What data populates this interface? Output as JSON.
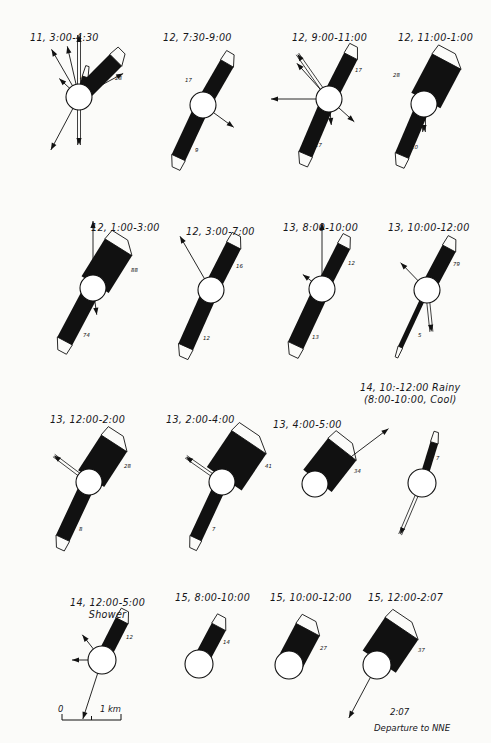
{
  "figure": {
    "type": "scientific-plume-diagram",
    "background_color": "#fbfbf9",
    "ink_color": "#111111",
    "panel_count": 16,
    "rows": 4,
    "columns": 4
  },
  "scale_bar": {
    "zero_label": "0",
    "length_label": "1 km"
  },
  "panels": [
    {
      "id": "p1",
      "title": "11, 3:00-4:30",
      "title_x": 30,
      "title_y": 32,
      "circle_cx": 79,
      "circle_cy": 97,
      "circle_r": 13,
      "plumes": [
        {
          "label": "28",
          "angle": -45,
          "length": 52,
          "width": 17,
          "label_dx": 36,
          "label_dy": -22
        },
        {
          "label": "4",
          "angle": -73,
          "length": 21,
          "width": 6,
          "label_dx": 1,
          "label_dy": -22
        }
      ],
      "arrows": [
        {
          "angle": -90,
          "length": 62,
          "double": true
        },
        {
          "angle": -120,
          "length": 55,
          "double": false
        },
        {
          "angle": -103,
          "length": 52,
          "double": false
        },
        {
          "angle": -137,
          "length": 27,
          "double": false
        },
        {
          "angle": -28,
          "length": 50,
          "double": false
        },
        {
          "angle": -38,
          "length": 32,
          "double": false
        },
        {
          "angle": 90,
          "length": 48,
          "double": true
        },
        {
          "angle": 118,
          "length": 60,
          "double": false
        }
      ]
    },
    {
      "id": "p2",
      "title": "12, 7:30-9:00",
      "title_x": 163,
      "title_y": 32,
      "circle_cx": 203,
      "circle_cy": 105,
      "circle_r": 13,
      "plumes": [
        {
          "label": "17",
          "angle": -60,
          "length": 48,
          "width": 15,
          "label_dx": -18,
          "label_dy": -28
        },
        {
          "label": "9",
          "angle": 115,
          "length": 58,
          "width": 15,
          "label_dx": -8,
          "label_dy": 42
        }
      ],
      "arrows": [
        {
          "angle": 36,
          "length": 38,
          "double": false
        }
      ]
    },
    {
      "id": "p3",
      "title": "12, 9:00-11:00",
      "title_x": 292,
      "title_y": 32,
      "circle_cx": 329,
      "circle_cy": 99,
      "circle_r": 13,
      "plumes": [
        {
          "label": "17",
          "angle": -63,
          "length": 48,
          "width": 15,
          "label_dx": 26,
          "label_dy": -32
        },
        {
          "label": "17",
          "angle": 113,
          "length": 60,
          "width": 15,
          "label_dx": -14,
          "label_dy": 43
        }
      ],
      "arrows": [
        {
          "angle": -125,
          "length": 55,
          "double": true
        },
        {
          "angle": -132,
          "length": 48,
          "double": false
        },
        {
          "angle": 180,
          "length": 58,
          "double": false
        },
        {
          "angle": 42,
          "length": 34,
          "double": false
        },
        {
          "angle": 85,
          "length": 26,
          "double": false
        }
      ]
    },
    {
      "id": "p4",
      "title": "12, 11:00-1:00",
      "title_x": 398,
      "title_y": 32,
      "circle_cx": 424,
      "circle_cy": 104,
      "circle_r": 13,
      "plumes": [
        {
          "label": "28",
          "angle": -62,
          "length": 48,
          "width": 33,
          "label_dx": -31,
          "label_dy": -32
        },
        {
          "label": "10",
          "angle": 113,
          "length": 56,
          "width": 15,
          "label_dx": -13,
          "label_dy": 40
        }
      ],
      "arrows": [
        {
          "angle": 90,
          "length": 28,
          "double": true
        }
      ]
    },
    {
      "id": "p5",
      "title": "12, 1:00-3:00",
      "title_x": 91,
      "title_y": 222,
      "circle_cx": 93,
      "circle_cy": 288,
      "circle_r": 13,
      "plumes": [
        {
          "label": "88",
          "angle": -58,
          "length": 48,
          "width": 32,
          "label_dx": 38,
          "label_dy": -21
        },
        {
          "label": "74",
          "angle": 118,
          "length": 60,
          "width": 17,
          "label_dx": -10,
          "label_dy": 44
        }
      ],
      "arrows": [
        {
          "angle": -90,
          "length": 67,
          "double": false
        },
        {
          "angle": 82,
          "length": 27,
          "double": false
        }
      ]
    },
    {
      "id": "p6",
      "title": "12, 3:00-7:00",
      "title_x": 186,
      "title_y": 226,
      "circle_cx": 211,
      "circle_cy": 290,
      "circle_r": 13,
      "plumes": [
        {
          "label": "16",
          "angle": -63,
          "length": 50,
          "width": 16,
          "label_dx": 25,
          "label_dy": -27
        },
        {
          "label": "12",
          "angle": 114,
          "length": 62,
          "width": 16,
          "label_dx": -8,
          "label_dy": 45
        }
      ],
      "arrows": [
        {
          "angle": -120,
          "length": 62,
          "double": false
        }
      ]
    },
    {
      "id": "p7",
      "title": "13, 8:00-10:00",
      "title_x": 283,
      "title_y": 222,
      "circle_cx": 322,
      "circle_cy": 289,
      "circle_r": 13,
      "plumes": [
        {
          "label": "12",
          "angle": -63,
          "length": 48,
          "width": 14,
          "label_dx": 26,
          "label_dy": -29
        },
        {
          "label": "13",
          "angle": 115,
          "length": 62,
          "width": 17,
          "label_dx": -10,
          "label_dy": 45
        }
      ],
      "arrows": [
        {
          "angle": -90,
          "length": 66,
          "double": false
        },
        {
          "angle": -143,
          "length": 24,
          "double": false
        }
      ]
    },
    {
      "id": "p8",
      "title": "13, 10:00-12:00",
      "title_x": 388,
      "title_y": 222,
      "circle_cx": 427,
      "circle_cy": 290,
      "circle_r": 13,
      "plumes": [
        {
          "label": "79",
          "angle": -62,
          "length": 47,
          "width": 15,
          "label_dx": 26,
          "label_dy": -29
        },
        {
          "label": "5",
          "angle": 115,
          "length": 63,
          "width": 5,
          "label_dx": -9,
          "label_dy": 42
        }
      ],
      "arrows": [
        {
          "angle": -134,
          "length": 38,
          "double": false
        },
        {
          "angle": 84,
          "length": 42,
          "double": true
        }
      ]
    },
    {
      "id": "p9",
      "title": "13, 12:00-2:00",
      "title_x": 50,
      "title_y": 414,
      "circle_cx": 89,
      "circle_cy": 482,
      "circle_r": 13,
      "plumes": [
        {
          "label": "28",
          "angle": -57,
          "length": 46,
          "width": 31,
          "label_dx": 35,
          "label_dy": -19
        },
        {
          "label": "8",
          "angle": 115,
          "length": 62,
          "width": 15,
          "label_dx": -10,
          "label_dy": 44
        }
      ],
      "arrows": [
        {
          "angle": -143,
          "length": 44,
          "double": true
        }
      ]
    },
    {
      "id": "p10",
      "title": "13, 2:00-4:00",
      "title_x": 166,
      "title_y": 414,
      "circle_cx": 222,
      "circle_cy": 482,
      "circle_r": 13,
      "plumes": [
        {
          "label": "41",
          "angle": -56,
          "length": 48,
          "width": 42,
          "label_dx": 43,
          "label_dy": -19
        },
        {
          "label": "7",
          "angle": 115,
          "length": 62,
          "width": 13,
          "label_dx": -10,
          "label_dy": 44
        }
      ],
      "arrows": [
        {
          "angle": -145,
          "length": 44,
          "double": true
        }
      ]
    },
    {
      "id": "p11",
      "title": "13, 4:00-5:00",
      "title_x": 273,
      "title_y": 419,
      "circle_cx": 315,
      "circle_cy": 484,
      "circle_r": 13,
      "plumes": [
        {
          "label": "34",
          "angle": -52,
          "length": 44,
          "width": 36,
          "label_dx": 39,
          "label_dy": -16
        }
      ],
      "arrows": [
        {
          "angle": -37,
          "length": 92,
          "double": false
        }
      ]
    },
    {
      "id": "p12",
      "title": "14, 10:-12:00 Rainy",
      "subtitle": "(8:00-10:00, Cool)",
      "title_x": 360,
      "title_y": 382,
      "circle_cx": 422,
      "circle_cy": 483,
      "circle_r": 14,
      "plumes": [
        {
          "label": "7",
          "angle": -73,
          "length": 42,
          "width": 8,
          "label_dx": 14,
          "label_dy": -28
        }
      ],
      "arrows": [
        {
          "angle": 113,
          "length": 56,
          "double": true
        }
      ]
    },
    {
      "id": "p13",
      "title": "14, 12:00-5:00",
      "subtitle": "Shower",
      "title_x": 70,
      "title_y": 597,
      "circle_cx": 102,
      "circle_cy": 660,
      "circle_r": 14,
      "plumes": [
        {
          "label": "12",
          "angle": -63,
          "length": 44,
          "width": 14,
          "label_dx": 24,
          "label_dy": -26
        }
      ],
      "arrows": [
        {
          "angle": -128,
          "length": 32,
          "double": false
        },
        {
          "angle": 180,
          "length": 30,
          "double": false
        },
        {
          "angle": 108,
          "length": 62,
          "double": false
        }
      ]
    },
    {
      "id": "p14",
      "title": "15, 8:00-10:00",
      "title_x": 175,
      "title_y": 592,
      "circle_cx": 199,
      "circle_cy": 664,
      "circle_r": 14,
      "plumes": [
        {
          "label": "14",
          "angle": -62,
          "length": 42,
          "width": 16,
          "label_dx": 24,
          "label_dy": -25
        }
      ],
      "arrows": []
    },
    {
      "id": "p15",
      "title": "15, 10:00-12:00",
      "title_x": 270,
      "title_y": 592,
      "circle_cx": 289,
      "circle_cy": 665,
      "circle_r": 14,
      "plumes": [
        {
          "label": "27",
          "angle": -62,
          "length": 40,
          "width": 27,
          "label_dx": 31,
          "label_dy": -20
        }
      ],
      "arrows": []
    },
    {
      "id": "p16",
      "title": "15, 12:00-2:07",
      "title_x": 368,
      "title_y": 592,
      "circle_cx": 377,
      "circle_cy": 665,
      "circle_r": 14,
      "plumes": [
        {
          "label": "37",
          "angle": -56,
          "length": 44,
          "width": 40,
          "label_dx": 41,
          "label_dy": -18
        }
      ],
      "arrows": [
        {
          "angle": 118,
          "length": 60,
          "double": false
        }
      ],
      "note_time": "2:07",
      "note_text": "Departure to NNE"
    }
  ]
}
